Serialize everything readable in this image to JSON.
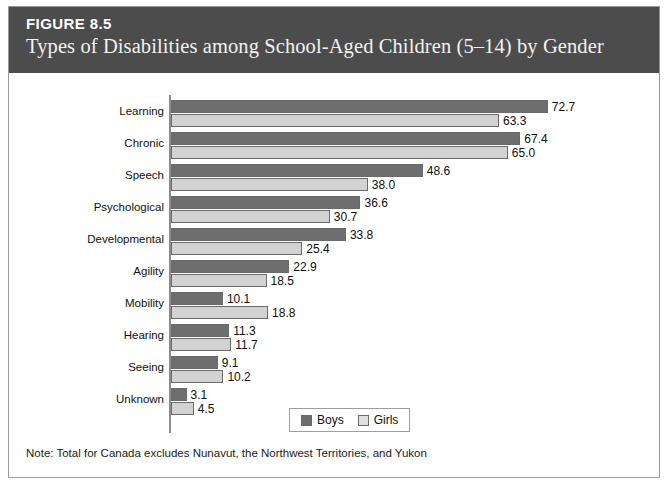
{
  "header": {
    "figure_number": "FIGURE 8.5",
    "title": "Types of Disabilities among School-Aged Children (5–14) by Gender"
  },
  "note": "Note: Total for Canada excludes Nunavut, the Northwest Territories, and Yukon",
  "legend": {
    "boys_label": "Boys",
    "girls_label": "Girls"
  },
  "colors": {
    "header_band": "#4c4c4c",
    "boys_bar": "#6e6e6e",
    "girls_bar": "#d2d2d2",
    "card_border": "#9a9a9a",
    "axis": "#8d8d8d"
  },
  "chart_data": {
    "type": "bar",
    "orientation": "horizontal",
    "title": "Types of Disabilities among School-Aged Children (5–14) by Gender",
    "xlabel": "",
    "ylabel": "",
    "xlim": [
      0,
      72.7
    ],
    "grid": false,
    "legend_position": "bottom-center",
    "categories": [
      "Learning",
      "Chronic",
      "Speech",
      "Psychological",
      "Developmental",
      "Agility",
      "Mobility",
      "Hearing",
      "Seeing",
      "Unknown"
    ],
    "series": [
      {
        "name": "Boys",
        "values": [
          72.7,
          67.4,
          48.6,
          36.6,
          33.8,
          22.9,
          10.1,
          11.3,
          9.1,
          3.1
        ],
        "labels": [
          "72.7",
          "67.4",
          "48.6",
          "36.6",
          "33.8",
          "22.9",
          "10.1",
          "11.3",
          "9.1",
          "3.1"
        ]
      },
      {
        "name": "Girls",
        "values": [
          63.3,
          65.0,
          38.0,
          30.7,
          25.4,
          18.5,
          18.8,
          11.7,
          10.2,
          4.5
        ],
        "labels": [
          "63.3",
          "65.0",
          "38.0",
          "30.7",
          "25.4",
          "18.5",
          "18.8",
          "11.7",
          "10.2",
          "4.5"
        ]
      }
    ]
  }
}
